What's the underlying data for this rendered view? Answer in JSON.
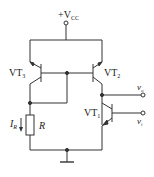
{
  "diagram": {
    "type": "circuit-schematic",
    "title": "",
    "supply": {
      "label": "+V",
      "subscript": "CC"
    },
    "transistors": [
      {
        "id": "VT3",
        "label": "VT",
        "subscript": "3",
        "type": "PNP"
      },
      {
        "id": "VT2",
        "label": "VT",
        "subscript": "2",
        "type": "PNP"
      },
      {
        "id": "VT1",
        "label": "VT",
        "subscript": "1",
        "type": "NPN"
      }
    ],
    "resistor": {
      "label": "R"
    },
    "current": {
      "label": "I",
      "subscript": "R"
    },
    "terminals": [
      {
        "id": "vo",
        "label": "v",
        "subscript": "o"
      },
      {
        "id": "vi",
        "label": "v",
        "subscript": "i"
      }
    ],
    "colors": {
      "line": "#333333",
      "background": "#ffffff"
    }
  }
}
